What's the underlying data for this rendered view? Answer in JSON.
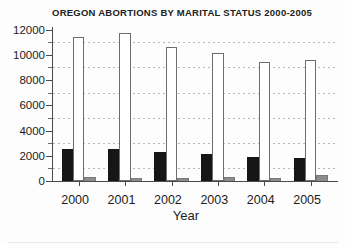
{
  "chart_data": {
    "type": "bar",
    "title": "OREGON ABORTIONS BY MARITAL STATUS 2000-2005",
    "xlabel": "Year",
    "ylabel": "",
    "categories": [
      "2000",
      "2001",
      "2002",
      "2003",
      "2004",
      "2005"
    ],
    "series": [
      {
        "name": "black-bar-series",
        "color": "#161616",
        "values": [
          2500,
          2550,
          2300,
          2100,
          1900,
          1850
        ]
      },
      {
        "name": "white-bar-series",
        "color": "#ffffff",
        "border_color": "#6e6e6e",
        "values": [
          11400,
          11750,
          10650,
          10150,
          9400,
          9600
        ]
      },
      {
        "name": "gray-bar-series",
        "color": "#8c8c8c",
        "values": [
          300,
          250,
          250,
          280,
          270,
          500
        ]
      }
    ],
    "ylim": [
      0,
      12000
    ],
    "ytick_step": 2000,
    "ytick_labels": [
      "0",
      "2000",
      "4000",
      "6000",
      "8000",
      "10000",
      "12000"
    ],
    "grid": "dashed horizontal gridlines at 1000,3000,5000,7000,9000,11000",
    "legend": "none"
  }
}
